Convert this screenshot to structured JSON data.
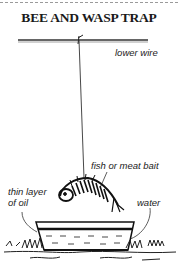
{
  "title": "BEE AND WASP TRAP",
  "labels": {
    "lower_wire": "lower wire",
    "bait": "fish or meat bait",
    "oil_line1": "thin layer",
    "oil_line2": "of oil",
    "water": "water"
  }
}
